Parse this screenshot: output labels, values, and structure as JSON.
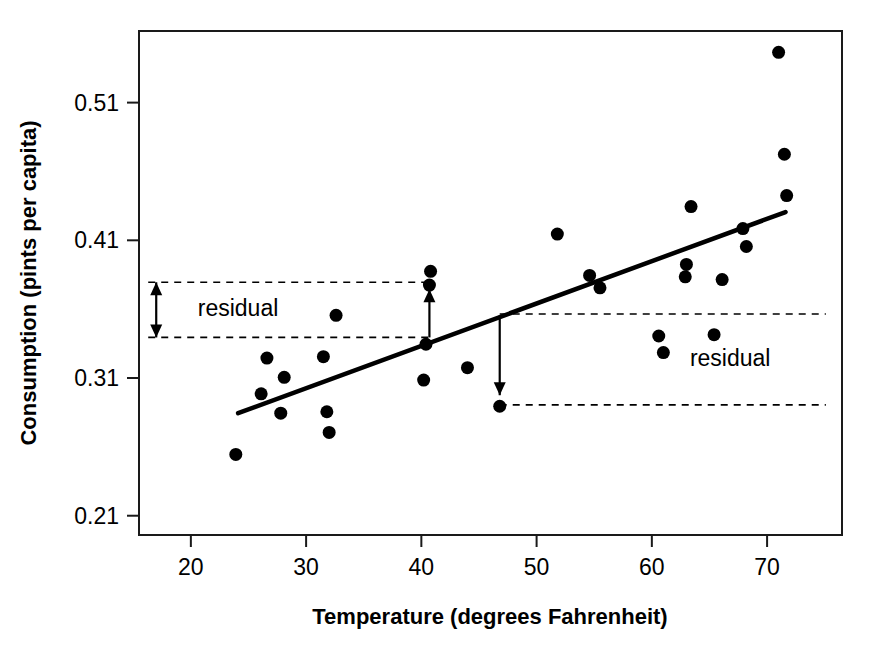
{
  "chart_data": {
    "type": "scatter",
    "title": "",
    "xlabel": "Temperature (degrees Fahrenheit)",
    "ylabel": "Consumption (pints per capita)",
    "xlim": [
      15.5,
      76.5
    ],
    "ylim": [
      0.196,
      0.562
    ],
    "xticks": [
      20,
      30,
      40,
      50,
      60,
      70
    ],
    "xticklabels": [
      "20",
      "30",
      "40",
      "50",
      "60",
      "70"
    ],
    "yticks": [
      0.21,
      0.31,
      0.41,
      0.51
    ],
    "yticklabels": [
      "0.21",
      "0.31",
      "0.41",
      "0.51"
    ],
    "grid": false,
    "legend": null,
    "point_color": "#000000",
    "line_color": "#000000",
    "points": [
      {
        "x": 23.9,
        "y": 0.2545
      },
      {
        "x": 26.1,
        "y": 0.2985
      },
      {
        "x": 26.6,
        "y": 0.3245
      },
      {
        "x": 27.8,
        "y": 0.2845
      },
      {
        "x": 28.1,
        "y": 0.3105
      },
      {
        "x": 31.5,
        "y": 0.3255
      },
      {
        "x": 31.8,
        "y": 0.2855
      },
      {
        "x": 32.0,
        "y": 0.2705
      },
      {
        "x": 32.6,
        "y": 0.3555
      },
      {
        "x": 40.2,
        "y": 0.3085
      },
      {
        "x": 40.4,
        "y": 0.3345
      },
      {
        "x": 40.7,
        "y": 0.3775
      },
      {
        "x": 40.8,
        "y": 0.3875
      },
      {
        "x": 44.0,
        "y": 0.3175
      },
      {
        "x": 46.8,
        "y": 0.2895
      },
      {
        "x": 51.8,
        "y": 0.4145
      },
      {
        "x": 54.6,
        "y": 0.3845
      },
      {
        "x": 55.5,
        "y": 0.3755
      },
      {
        "x": 60.6,
        "y": 0.3405
      },
      {
        "x": 61.0,
        "y": 0.3285
      },
      {
        "x": 62.9,
        "y": 0.3835
      },
      {
        "x": 63.0,
        "y": 0.3925
      },
      {
        "x": 63.4,
        "y": 0.4345
      },
      {
        "x": 65.4,
        "y": 0.3415
      },
      {
        "x": 66.1,
        "y": 0.3815
      },
      {
        "x": 67.9,
        "y": 0.4185
      },
      {
        "x": 68.2,
        "y": 0.4055
      },
      {
        "x": 71.0,
        "y": 0.5465
      },
      {
        "x": 71.5,
        "y": 0.4725
      },
      {
        "x": 71.7,
        "y": 0.4425
      }
    ],
    "fit_line": {
      "label": "least squares regression line",
      "x_start": 24.1,
      "y_start": 0.2845,
      "x_end": 71.6,
      "y_end": 0.4305
    },
    "annotations": [
      {
        "name": "residual-positive",
        "label": "residual",
        "arrow_direction": "up",
        "arrow_x": 40.7,
        "arrow_y_from": 0.3395,
        "arrow_y_to": 0.3745,
        "guide_upper_y": 0.3795,
        "guide_lower_y": 0.3395,
        "guide_x_from": 16.3,
        "guide_x_to": 40.7,
        "label_x": 20.6,
        "label_y": 0.3605
      },
      {
        "name": "residual-negative",
        "label": "residual",
        "arrow_direction": "down",
        "arrow_x": 46.8,
        "arrow_y_from": 0.3555,
        "arrow_y_to": 0.2975,
        "guide_upper_y": 0.3565,
        "guide_lower_y": 0.2905,
        "guide_x_from": 46.8,
        "guide_x_to": 75.1,
        "label_x": 63.3,
        "label_y": 0.3245
      }
    ]
  }
}
